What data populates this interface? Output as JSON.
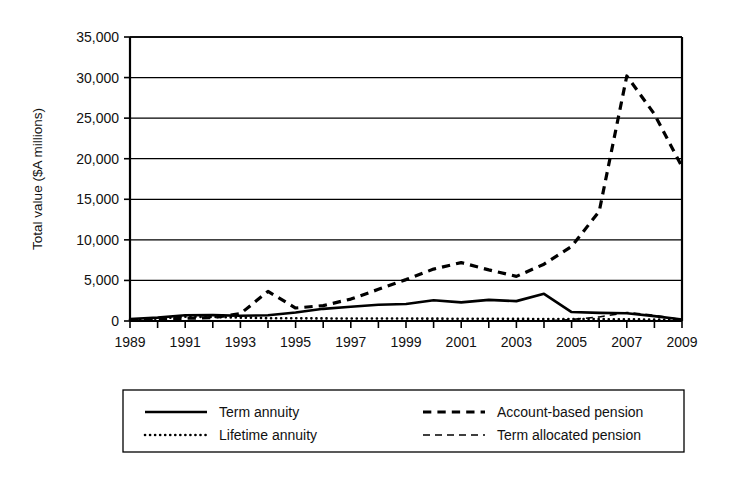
{
  "chart_data": {
    "type": "line",
    "title": "",
    "xlabel": "",
    "ylabel": "Total value ($A millions)",
    "xlim": [
      1989,
      2009
    ],
    "ylim": [
      0,
      35000
    ],
    "grid": true,
    "legend_position": "bottom",
    "y_ticks": [
      0,
      5000,
      10000,
      15000,
      20000,
      25000,
      30000,
      35000
    ],
    "y_tick_labels": [
      "0",
      "5,000",
      "10,000",
      "15,000",
      "20,000",
      "25,000",
      "30,000",
      "35,000"
    ],
    "x_ticks": [
      1989,
      1990,
      1991,
      1992,
      1993,
      1994,
      1995,
      1996,
      1997,
      1998,
      1999,
      2000,
      2001,
      2002,
      2003,
      2004,
      2005,
      2006,
      2007,
      2008,
      2009
    ],
    "x_tick_labels": [
      "1989",
      "",
      "1991",
      "",
      "1993",
      "",
      "1995",
      "",
      "1997",
      "",
      "1999",
      "",
      "2001",
      "",
      "2003",
      "",
      "2005",
      "",
      "2007",
      "",
      "2009"
    ],
    "x": [
      1989,
      1990,
      1991,
      1992,
      1993,
      1994,
      1995,
      1996,
      1997,
      1998,
      1999,
      2000,
      2001,
      2002,
      2003,
      2004,
      2005,
      2006,
      2007,
      2008,
      2009
    ],
    "series": [
      {
        "name": "Term annuity",
        "style": "solid",
        "color": "#000000",
        "width": 2.6,
        "values": [
          250,
          420,
          700,
          720,
          650,
          700,
          1050,
          1500,
          1750,
          2000,
          2100,
          2550,
          2300,
          2600,
          2450,
          3350,
          1100,
          1000,
          950,
          600,
          180
        ]
      },
      {
        "name": "Lifetime annuity",
        "style": "dotted",
        "color": "#000000",
        "width": 2.6,
        "values": [
          180,
          300,
          520,
          500,
          420,
          350,
          330,
          320,
          300,
          300,
          300,
          290,
          280,
          270,
          260,
          250,
          240,
          230,
          210,
          180,
          120
        ]
      },
      {
        "name": "Account-based pension",
        "style": "dashed",
        "color": "#000000",
        "width": 3.2,
        "values": [
          120,
          200,
          330,
          420,
          900,
          3650,
          1600,
          1900,
          2700,
          3900,
          5100,
          6400,
          7200,
          6300,
          5500,
          7000,
          9200,
          13500,
          30200,
          25500,
          19000
        ]
      },
      {
        "name": "Term allocated pension",
        "style": "dash-thin",
        "color": "#000000",
        "width": 1.6,
        "values": [
          0,
          0,
          0,
          0,
          0,
          0,
          0,
          0,
          0,
          0,
          0,
          0,
          0,
          0,
          0,
          0,
          180,
          500,
          1050,
          700,
          150
        ]
      }
    ]
  },
  "legend": {
    "entries": [
      {
        "label": "Term annuity",
        "marker": "solid-line"
      },
      {
        "label": "Lifetime annuity",
        "marker": "dotted-line"
      },
      {
        "label": "Account-based pension",
        "marker": "dashed-line"
      },
      {
        "label": "Term allocated pension",
        "marker": "thin-dashed-line"
      }
    ]
  }
}
